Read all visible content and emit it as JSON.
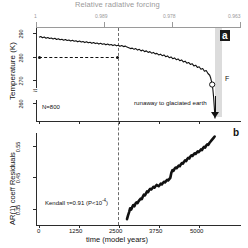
{
  "figure": {
    "top_axis_title": "Relative radiative forcing",
    "top_axis_ticks": [
      "1",
      "0.989",
      "0.978",
      "0.963"
    ]
  },
  "panel_a": {
    "letter": "a",
    "ylabel": "Temperature (K)",
    "yticks": [
      "290",
      "280",
      "270",
      "260"
    ],
    "n_label": "N=800",
    "runaway_label": "runaway to glaciated earth",
    "of_label": "F",
    "circle_marker": "open-circle"
  },
  "panel_b": {
    "letter": "b",
    "ylabel": "AR(1) coeff  Residuals",
    "yticks": [
      "0.55",
      "0.45",
      "0.35"
    ],
    "xlabel": "time (model years)",
    "xticks": [
      "0",
      "1250",
      "2500",
      "3750",
      "5000"
    ],
    "kendall_label": "Kendall τ=0.91 (P<10",
    "kendall_exponent": "-4",
    "kendall_close": ")"
  },
  "colors": {
    "data": "#111111",
    "axis": "#2b2b2b",
    "top_axis": "#9a9a9a",
    "band": "#dcdcdc",
    "dash": "#6b6b6b"
  },
  "chart_data": [
    {
      "type": "line",
      "panel": "a",
      "title": "Temperature (K) vs time (model years)",
      "xlabel": "time (model years)",
      "ylabel": "Temperature (K)",
      "xlim": [
        0,
        5000
      ],
      "ylim": [
        255,
        292
      ],
      "grid": false,
      "legend": null,
      "annotations": [
        {
          "text": "N=800",
          "x": 300,
          "y": 259
        },
        {
          "text": "runaway to glaciated earth",
          "x": 3050,
          "y": 262
        },
        {
          "text": "F",
          "x": 4870,
          "y": 269
        },
        {
          "text": "a",
          "x": 4930,
          "y": 290
        },
        {
          "text": "vertical dashed line",
          "x": 2500
        },
        {
          "text": "horizontal dashed line",
          "y": 280
        }
      ],
      "secondary_xaxis": {
        "label": "Relative radiative forcing",
        "tick_positions": [
          0,
          1650,
          3300,
          4950
        ],
        "tick_labels": [
          "1",
          "0.989",
          "0.978",
          "0.963"
        ]
      },
      "x": [
        0,
        50,
        100,
        150,
        200,
        250,
        300,
        350,
        400,
        450,
        500,
        550,
        600,
        650,
        700,
        750,
        800,
        850,
        900,
        950,
        1000,
        1050,
        1100,
        1150,
        1200,
        1250,
        1300,
        1350,
        1400,
        1450,
        1500,
        1550,
        1600,
        1650,
        1700,
        1750,
        1800,
        1850,
        1900,
        1950,
        2000,
        2050,
        2100,
        2150,
        2200,
        2250,
        2300,
        2350,
        2400,
        2450,
        2500,
        2550,
        2600,
        2650,
        2700,
        2750,
        2800,
        2850,
        2900,
        2950,
        3000,
        3050,
        3100,
        3150,
        3200,
        3250,
        3300,
        3350,
        3400,
        3450,
        3500,
        3550,
        3600,
        3650,
        3700,
        3750,
        3800,
        3850,
        3900,
        3950,
        4000,
        4050,
        4100,
        4150,
        4200,
        4250,
        4300,
        4350,
        4400,
        4450,
        4500,
        4550,
        4600,
        4650,
        4700,
        4750,
        4800,
        4850,
        4880,
        4900,
        4920,
        4940,
        4960,
        4980,
        5000
      ],
      "y": [
        288.3,
        288.6,
        288.1,
        288.4,
        287.9,
        288.2,
        287.8,
        288.0,
        287.6,
        287.9,
        287.4,
        287.7,
        287.3,
        287.5,
        287.1,
        287.4,
        287.0,
        287.2,
        286.8,
        287.1,
        286.7,
        286.9,
        286.5,
        286.8,
        286.4,
        286.6,
        286.2,
        286.5,
        286.1,
        286.3,
        285.9,
        286.2,
        285.8,
        286.0,
        285.6,
        285.9,
        285.5,
        285.7,
        285.3,
        285.6,
        285.2,
        285.4,
        285.0,
        285.3,
        284.9,
        285.1,
        284.7,
        285.0,
        284.6,
        284.8,
        284.4,
        284.1,
        283.8,
        284.0,
        283.5,
        283.8,
        283.2,
        283.5,
        282.9,
        283.2,
        282.6,
        282.9,
        282.3,
        282.6,
        282.0,
        282.3,
        281.7,
        281.9,
        281.3,
        281.6,
        281.0,
        281.3,
        280.6,
        280.9,
        280.2,
        280.5,
        279.8,
        280.1,
        279.4,
        279.7,
        279.0,
        279.3,
        278.5,
        278.8,
        278.0,
        278.3,
        277.5,
        277.8,
        276.9,
        277.2,
        276.3,
        276.6,
        275.6,
        275.9,
        274.8,
        275.1,
        273.9,
        273.2,
        272.0,
        270.8,
        269.5,
        267.5,
        264.5,
        260.5,
        256.0
      ]
    },
    {
      "type": "line",
      "panel": "b",
      "title": "AR(1) coefficient of residuals vs time",
      "xlabel": "time (model years)",
      "ylabel": "AR(1) coeff  Residuals",
      "xlim": [
        0,
        5000
      ],
      "ylim": [
        0.3,
        0.585
      ],
      "grid": false,
      "legend": null,
      "annotations": [
        {
          "text": "Kendall τ=0.91 (P<10^-4)",
          "x": 500,
          "y": 0.345
        },
        {
          "text": "b",
          "x": 4950,
          "y": 0.575
        },
        {
          "text": "vertical dashed line",
          "x": 2500
        }
      ],
      "x": [
        2500,
        2530,
        2560,
        2590,
        2620,
        2650,
        2680,
        2710,
        2740,
        2770,
        2800,
        2830,
        2860,
        2890,
        2920,
        2950,
        2980,
        3010,
        3040,
        3070,
        3100,
        3130,
        3160,
        3190,
        3220,
        3250,
        3280,
        3310,
        3340,
        3370,
        3400,
        3430,
        3460,
        3490,
        3520,
        3550,
        3580,
        3610,
        3640,
        3670,
        3700,
        3730,
        3760,
        3790,
        3820,
        3850,
        3880,
        3910,
        3940,
        3970,
        4000,
        4030,
        4060,
        4090,
        4120,
        4150,
        4180,
        4210,
        4240,
        4270,
        4300,
        4330,
        4360,
        4390,
        4420,
        4450,
        4480,
        4510,
        4540,
        4570,
        4600,
        4630,
        4660,
        4690,
        4720,
        4750,
        4780,
        4810,
        4840,
        4870,
        4900,
        4930,
        4960,
        4990
      ],
      "y": [
        0.318,
        0.33,
        0.34,
        0.352,
        0.348,
        0.356,
        0.362,
        0.358,
        0.366,
        0.37,
        0.368,
        0.374,
        0.378,
        0.382,
        0.38,
        0.388,
        0.394,
        0.392,
        0.398,
        0.404,
        0.402,
        0.408,
        0.412,
        0.41,
        0.414,
        0.418,
        0.416,
        0.42,
        0.424,
        0.422,
        0.42,
        0.424,
        0.428,
        0.426,
        0.43,
        0.434,
        0.432,
        0.436,
        0.44,
        0.438,
        0.442,
        0.446,
        0.462,
        0.47,
        0.468,
        0.474,
        0.478,
        0.476,
        0.48,
        0.484,
        0.482,
        0.488,
        0.492,
        0.49,
        0.496,
        0.5,
        0.498,
        0.504,
        0.508,
        0.506,
        0.512,
        0.516,
        0.514,
        0.518,
        0.522,
        0.52,
        0.524,
        0.528,
        0.526,
        0.53,
        0.534,
        0.532,
        0.538,
        0.542,
        0.54,
        0.546,
        0.55,
        0.548,
        0.554,
        0.558,
        0.562,
        0.566,
        0.57,
        0.574
      ]
    }
  ]
}
